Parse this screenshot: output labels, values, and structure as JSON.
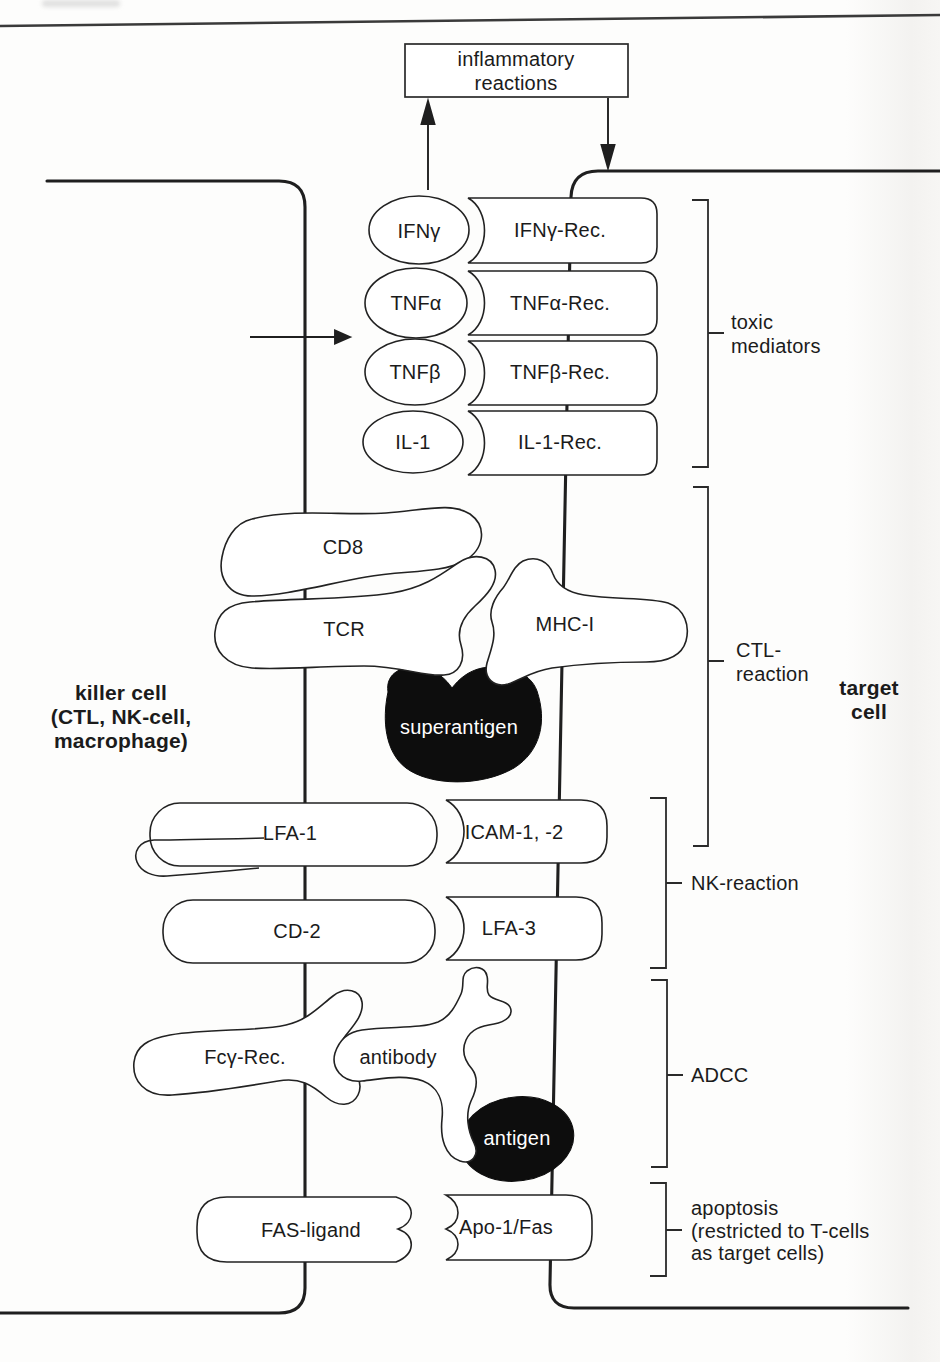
{
  "figure": {
    "title_box": {
      "line1": "inflammatory",
      "line2": "reactions"
    },
    "cells": {
      "killer": {
        "line1": "killer cell",
        "line2": "(CTL, NK-cell,",
        "line3": "macrophage)"
      },
      "target": {
        "line1": "target",
        "line2": "cell"
      }
    },
    "ligand_rows": [
      {
        "ligand": "IFNγ",
        "receptor": "IFNγ-Rec."
      },
      {
        "ligand": "TNFα",
        "receptor": "TNFα-Rec."
      },
      {
        "ligand": "TNFβ",
        "receptor": "TNFβ-Rec."
      },
      {
        "ligand": "IL-1",
        "receptor": "IL-1-Rec."
      }
    ],
    "ctl_complex": {
      "cd8": "CD8",
      "tcr": "TCR",
      "mhc": "MHC-I",
      "superantigen": "superantigen"
    },
    "adhesion_rows": [
      {
        "left": "LFA-1",
        "right": "ICAM-1, -2"
      },
      {
        "left": "CD-2",
        "right": "LFA-3"
      }
    ],
    "adcc_complex": {
      "fc_receptor": "Fcγ-Rec.",
      "antibody": "antibody",
      "antigen": "antigen"
    },
    "fas_row": {
      "left": "FAS-ligand",
      "right": "Apo-1/Fas"
    },
    "brackets": {
      "toxic": {
        "line1": "toxic",
        "line2": "mediators"
      },
      "ctl": {
        "line1": "CTL-",
        "line2": "reaction"
      },
      "nk": {
        "line1": "NK-reaction"
      },
      "adcc": {
        "line1": "ADCC"
      },
      "apoptosis": {
        "line1": "apoptosis",
        "line2": "(restricted to T-cells",
        "line3": "as target cells)"
      }
    },
    "colors": {
      "ink": "#1f1f1f",
      "fill_black": "#0d0d0d",
      "paper": "#fdfdfc"
    }
  }
}
